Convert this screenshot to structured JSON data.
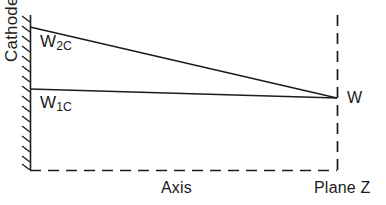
{
  "figure": {
    "kind": "technical-line-diagram",
    "background_color": "#ffffff",
    "line_color": "#1b1b1b",
    "text_color": "#1b1b1b"
  },
  "labels": {
    "cathode": "Cathode",
    "w2c_base": "W",
    "w2c_sub": "2C",
    "w1c_base": "W",
    "w1c_sub": "1C",
    "w": "W",
    "axis": "Axis",
    "plane_z": "Plane Z"
  },
  "geometry": {
    "cathode_wall": {
      "x": 30,
      "y_top": 15,
      "y_bottom": 170
    },
    "sloped_line_w2c": {
      "x1": 30,
      "y1": 27,
      "x2": 337,
      "y2": 98
    },
    "horizontal_line_w1c": {
      "x1": 30,
      "y1": 89,
      "x2": 337,
      "y2": 98
    },
    "axis_dashed": {
      "x1": 30,
      "y1": 170,
      "x2": 337,
      "y2": 170
    },
    "plane_z_dashed": {
      "x": 337,
      "y_top": 15,
      "y_bottom": 170
    },
    "convergence_point": {
      "x": 337,
      "y": 98
    }
  }
}
